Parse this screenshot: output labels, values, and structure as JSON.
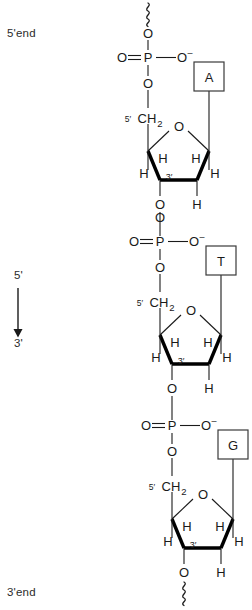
{
  "diagram": {
    "end_labels": {
      "top": "5'end",
      "bottom": "3'end"
    },
    "direction_arrow": {
      "from": "5'",
      "to": "3'",
      "orientation": "downward"
    },
    "colors": {
      "line": "#1a1a1a",
      "bold_bond": "#000000",
      "text": "#2b2b2b",
      "background": "#ffffff",
      "box_border": "#3a3a3a"
    },
    "atom_labels": {
      "oxygen": "O",
      "oxygen_anion": "O",
      "oxygen_anion_charge": "–",
      "phosphorus": "P",
      "hydrogen": "H",
      "methylene": "CH",
      "methylene_sub": "2",
      "carbon5_prime": "5′",
      "carbon3_prime": "3′"
    },
    "nucleotides": [
      {
        "index": 1,
        "base": "A",
        "base_name": "adenine",
        "phosphate": {
          "center": "P",
          "double_bond_oxygen": "O",
          "anionic_oxygen": "O",
          "anionic_charge": "–",
          "ester_oxygen_top": "O",
          "ester_oxygen_bottom": "O"
        },
        "sugar": {
          "ring_oxygen": "O",
          "c5_label": "5′",
          "c5_group": "CH",
          "c5_subscript": "2",
          "c3_label": "3′",
          "hydrogens": [
            "H",
            "H",
            "H",
            "H",
            "H"
          ],
          "c3_oxygen": "O"
        },
        "continuation_squiggle_above": true
      },
      {
        "index": 2,
        "base": "T",
        "base_name": "thymine",
        "phosphate": {
          "center": "P",
          "double_bond_oxygen": "O",
          "anionic_oxygen": "O",
          "anionic_charge": "–",
          "ester_oxygen_top": "O",
          "ester_oxygen_bottom": "O"
        },
        "sugar": {
          "ring_oxygen": "O",
          "c5_label": "5′",
          "c5_group": "CH",
          "c5_subscript": "2",
          "c3_label": "3′",
          "hydrogens": [
            "H",
            "H",
            "H",
            "H",
            "H"
          ],
          "c3_oxygen": "O"
        },
        "continuation_squiggle_above": false
      },
      {
        "index": 3,
        "base": "G",
        "base_name": "guanine",
        "phosphate": {
          "center": "P",
          "double_bond_oxygen": "O",
          "anionic_oxygen": "O",
          "anionic_charge": "–",
          "ester_oxygen_top": "O",
          "ester_oxygen_bottom": "O"
        },
        "sugar": {
          "ring_oxygen": "O",
          "c5_label": "5′",
          "c5_group": "CH",
          "c5_subscript": "2",
          "c3_label": "3′",
          "hydrogens": [
            "H",
            "H",
            "H",
            "H",
            "H"
          ],
          "c3_oxygen": "O"
        },
        "continuation_squiggle_below": true
      }
    ]
  }
}
